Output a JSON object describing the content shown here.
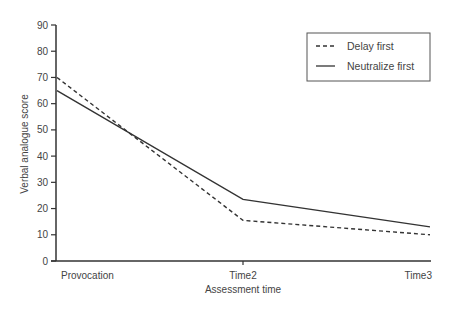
{
  "chart_data": {
    "type": "line",
    "title": "",
    "xlabel": "Assessment time",
    "ylabel": "Verbal analogue score",
    "categories": [
      "Provocation",
      "Time2",
      "Time3"
    ],
    "ylim": [
      0,
      90
    ],
    "yticks": [
      0,
      10,
      20,
      30,
      40,
      50,
      60,
      70,
      80,
      90
    ],
    "ytick_labels": [
      "0",
      "10",
      "20",
      "30",
      "40",
      "50",
      "60",
      "70",
      "80",
      "90"
    ],
    "grid": false,
    "legend_position": "top-right",
    "series": [
      {
        "name": "Delay first",
        "style": "dashed",
        "color": "#333333",
        "values": [
          70,
          15.5,
          10
        ]
      },
      {
        "name": "Neutralize first",
        "style": "solid",
        "color": "#333333",
        "values": [
          65,
          23.5,
          13
        ]
      }
    ]
  }
}
